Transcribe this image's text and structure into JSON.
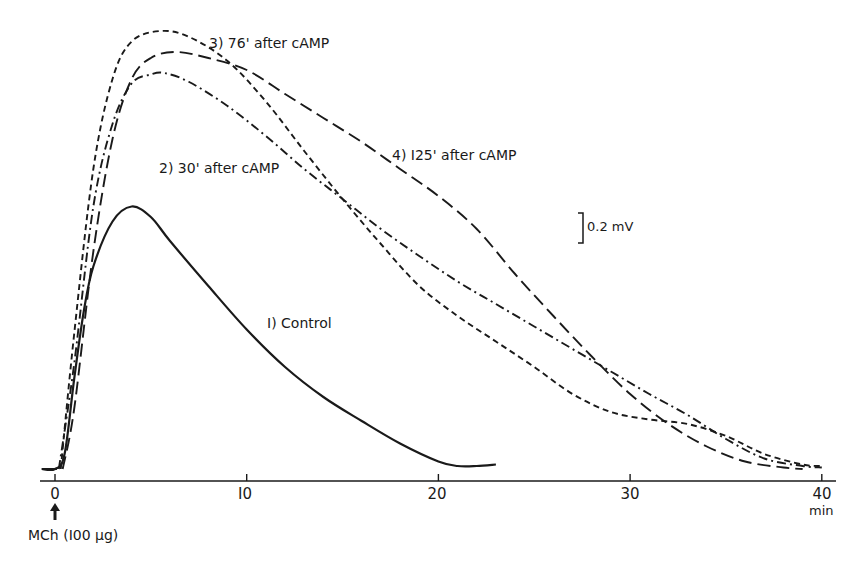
{
  "chart_data": {
    "type": "line",
    "title": "",
    "xlabel": "min",
    "ylabel": "",
    "xlim": [
      0,
      40
    ],
    "x_ticks": [
      0,
      10,
      20,
      30,
      40
    ],
    "x_tick_labels": [
      "0",
      "10",
      "20",
      "30",
      "40"
    ],
    "scale_bar": {
      "label": "0.2 mV",
      "value": 0.2
    },
    "annotation": {
      "label": "MCh (100 µg)",
      "x": 0,
      "marker": "up-arrow"
    },
    "grid": false,
    "legend": "inline labels",
    "series": [
      {
        "name": "1) Control",
        "style": "solid",
        "x": [
          -0.7,
          0,
          0.5,
          1,
          1.5,
          2,
          3,
          4,
          5,
          6,
          8,
          10,
          12,
          14,
          16,
          18,
          20,
          21,
          22,
          23
        ],
        "y": [
          0,
          0,
          0.1,
          0.6,
          1.05,
          1.35,
          1.65,
          1.75,
          1.68,
          1.52,
          1.22,
          0.93,
          0.68,
          0.48,
          0.32,
          0.17,
          0.05,
          0.02,
          0.02,
          0.03
        ]
      },
      {
        "name": "2) 30' after cAMP",
        "style": "dash-dot",
        "x": [
          0.2,
          1,
          2,
          3,
          4,
          5,
          5.7,
          7,
          9,
          11,
          13,
          15,
          17,
          19,
          21,
          23,
          25,
          27,
          29,
          31,
          33,
          35,
          37,
          39,
          40
        ],
        "y": [
          0,
          0.7,
          1.75,
          2.3,
          2.57,
          2.63,
          2.64,
          2.58,
          2.42,
          2.22,
          2.0,
          1.8,
          1.6,
          1.42,
          1.25,
          1.1,
          0.95,
          0.8,
          0.65,
          0.5,
          0.36,
          0.2,
          0.07,
          0.02,
          0.01
        ]
      },
      {
        "name": "3) 76' after cAMP",
        "style": "short-dash",
        "x": [
          0.3,
          1,
          2,
          3,
          4,
          5.5,
          7,
          9,
          11,
          13,
          15,
          17,
          19,
          21,
          23,
          25,
          27,
          29,
          31,
          33,
          35,
          37,
          39,
          40
        ],
        "y": [
          0,
          0.9,
          2.0,
          2.6,
          2.85,
          2.92,
          2.88,
          2.72,
          2.45,
          2.12,
          1.8,
          1.5,
          1.22,
          1.02,
          0.85,
          0.68,
          0.5,
          0.38,
          0.33,
          0.3,
          0.22,
          0.1,
          0.03,
          0.02
        ]
      },
      {
        "name": "4) 125' after cAMP",
        "style": "long-dash",
        "x": [
          0.4,
          1,
          2,
          3,
          4,
          5,
          6.3,
          8,
          10,
          12,
          14,
          16,
          18,
          20,
          22,
          24,
          26,
          28,
          30,
          32,
          34,
          36,
          38,
          39
        ],
        "y": [
          0,
          0.4,
          1.45,
          2.2,
          2.6,
          2.74,
          2.78,
          2.74,
          2.66,
          2.5,
          2.34,
          2.18,
          2.0,
          1.82,
          1.6,
          1.3,
          1.02,
          0.75,
          0.5,
          0.3,
          0.15,
          0.05,
          0.01,
          0.0
        ]
      }
    ]
  },
  "labels": {
    "curve1": "I) Control",
    "curve2": "2) 30' after cAMP",
    "curve3": "3) 76' after cAMP",
    "curve4": "4) I25' after cAMP",
    "scale": "0.2 mV",
    "x_unit": "min",
    "stimulus": "MCh (I00 µg)",
    "ticks": [
      "0",
      "I0",
      "20",
      "30",
      "40"
    ]
  }
}
